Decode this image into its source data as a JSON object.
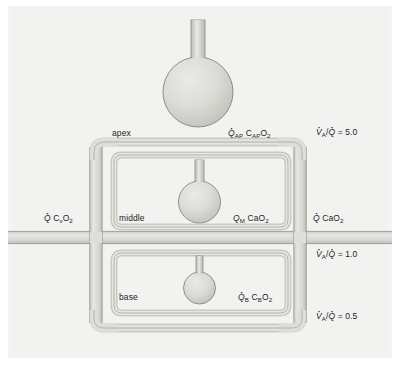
{
  "figure": {
    "background_color": "#f2f2f0",
    "tube_fill_color": "#d7d7d3",
    "tube_edge_color": "#8a8a86",
    "alveolus_fill_color": "#d5d5d1",
    "text_color": "#1d1d1d"
  },
  "regions": [
    {
      "id": "apex",
      "label": "apex",
      "va_q_label": "V",
      "va_q_sub": "A",
      "va_q_value": "5.0"
    },
    {
      "id": "middle",
      "label": "middle",
      "va_q_label": "V",
      "va_q_sub": "A",
      "va_q_value": "1.0"
    },
    {
      "id": "base",
      "label": "base",
      "va_q_label": "V",
      "va_q_sub": "A",
      "va_q_value": "0.5"
    }
  ],
  "labels": {
    "apex": "apex",
    "middle": "middle",
    "base": "base",
    "inflow": {
      "q": "Q",
      "content": "C",
      "content_sub": "v",
      "content_tail": "O",
      "content_tail_sub": "2"
    },
    "outflow": {
      "q": "Q",
      "content": "CaO",
      "content_sub": "2"
    },
    "apex_flow": {
      "q": "Q",
      "q_sub": "AP",
      "content": "C",
      "content_sub": "AP",
      "content_tail": "O",
      "content_tail_sub": "2"
    },
    "middle_flow": {
      "q": "Q",
      "q_sub": "M",
      "content": "CaO",
      "content_sub": "2"
    },
    "base_flow": {
      "q": "Q",
      "q_sub": "B",
      "content": "C",
      "content_sub": "B",
      "content_tail": "O",
      "content_tail_sub": "2"
    },
    "ratio_apex": {
      "numerator": "V",
      "numerator_sub": "A",
      "denominator": "Q",
      "equals": "=",
      "value": "5.0"
    },
    "ratio_middle": {
      "numerator": "V",
      "numerator_sub": "A",
      "denominator": "Q",
      "equals": "=",
      "value": "1.0"
    },
    "ratio_base": {
      "numerator": "V",
      "numerator_sub": "A",
      "denominator": "Q",
      "equals": "=",
      "value": "0.5"
    }
  }
}
